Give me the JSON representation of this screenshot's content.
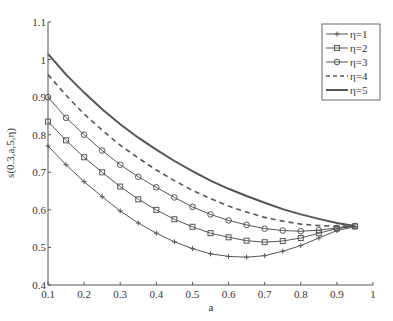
{
  "chart_data": {
    "type": "line",
    "title": "",
    "xlabel": "a",
    "ylabel": "s(0.3,a,5,η)",
    "xlim": [
      0.1,
      1
    ],
    "ylim": [
      0.4,
      1.1
    ],
    "xticks": [
      "0.1",
      "0.2",
      "0.3",
      "0.4",
      "0.5",
      "0.6",
      "0.7",
      "0.8",
      "0.9",
      "1"
    ],
    "yticks": [
      "0.4",
      "0.5",
      "0.6",
      "0.7",
      "0.8",
      "0.9",
      "1",
      "1.1"
    ],
    "grid": false,
    "legend_position": "upper right",
    "x": [
      0.1,
      0.15,
      0.2,
      0.25,
      0.3,
      0.35,
      0.4,
      0.45,
      0.5,
      0.55,
      0.6,
      0.65,
      0.7,
      0.75,
      0.8,
      0.85,
      0.9,
      0.95
    ],
    "series": [
      {
        "name": "η=1",
        "marker": "plus",
        "dash": "solid",
        "width": 1,
        "values": [
          0.77,
          0.72,
          0.675,
          0.635,
          0.597,
          0.565,
          0.538,
          0.515,
          0.497,
          0.483,
          0.476,
          0.474,
          0.478,
          0.49,
          0.505,
          0.525,
          0.545,
          0.555
        ]
      },
      {
        "name": "η=2",
        "marker": "square",
        "dash": "solid",
        "width": 1,
        "values": [
          0.835,
          0.785,
          0.74,
          0.7,
          0.662,
          0.628,
          0.6,
          0.575,
          0.555,
          0.538,
          0.527,
          0.518,
          0.514,
          0.517,
          0.525,
          0.538,
          0.55,
          0.556
        ]
      },
      {
        "name": "η=3",
        "marker": "circle",
        "dash": "solid",
        "width": 1,
        "values": [
          0.9,
          0.845,
          0.8,
          0.758,
          0.72,
          0.688,
          0.66,
          0.633,
          0.608,
          0.588,
          0.572,
          0.56,
          0.55,
          0.545,
          0.543,
          0.546,
          0.552,
          0.557
        ]
      },
      {
        "name": "η=4",
        "marker": "none",
        "dash": "dashed",
        "width": 1.6,
        "values": [
          0.96,
          0.905,
          0.855,
          0.812,
          0.772,
          0.738,
          0.706,
          0.678,
          0.652,
          0.63,
          0.61,
          0.594,
          0.58,
          0.57,
          0.562,
          0.558,
          0.556,
          0.557
        ]
      },
      {
        "name": "η=5",
        "marker": "none",
        "dash": "solid",
        "width": 2,
        "values": [
          1.015,
          0.96,
          0.912,
          0.868,
          0.828,
          0.792,
          0.76,
          0.73,
          0.703,
          0.678,
          0.656,
          0.637,
          0.619,
          0.602,
          0.588,
          0.576,
          0.565,
          0.557
        ]
      }
    ]
  }
}
